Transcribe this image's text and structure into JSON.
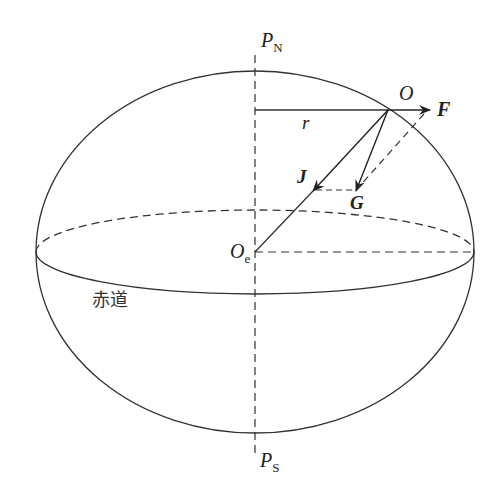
{
  "diagram": {
    "type": "earth-ellipsoid-force-decomposition",
    "labels": {
      "north_pole": {
        "main": "P",
        "sub": "N"
      },
      "south_pole": {
        "main": "P",
        "sub": "S"
      },
      "earth_center": {
        "main": "O",
        "sub": "e"
      },
      "point_o": "O",
      "radius_r": "r",
      "force_f": "F",
      "force_j": "J",
      "force_g": "G",
      "equator": "赤道"
    },
    "colors": {
      "line": "#333333",
      "background": "#ffffff"
    },
    "geometry": {
      "ellipse": {
        "cx": 255,
        "cy": 252,
        "rx": 219,
        "ry": 181
      },
      "equator": {
        "cx": 255,
        "cy": 252,
        "rx": 219,
        "ry": 42
      },
      "axis_x": 255,
      "point_o": [
        388,
        110
      ],
      "f_tip": [
        430,
        110
      ],
      "j_tip": [
        313,
        191
      ],
      "g_tip": [
        356,
        191
      ]
    }
  }
}
